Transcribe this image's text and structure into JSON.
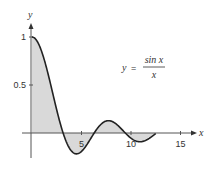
{
  "chart_data": {
    "type": "area",
    "title": "",
    "function": "sin(x)/x",
    "annotation": {
      "lhs": "y",
      "equals": "=",
      "numerator": "sin x",
      "denominator": "x"
    },
    "xlabel": "x",
    "ylabel": "y",
    "xlim": [
      0,
      16.5
    ],
    "ylim": [
      -0.3,
      1.1
    ],
    "x_ticks": [
      5,
      10,
      15
    ],
    "x_tick_labels": [
      "5",
      "10",
      "15"
    ],
    "y_ticks": [
      0.5,
      1
    ],
    "y_tick_labels": [
      "0.5",
      "1"
    ],
    "shaded_interval": [
      0,
      12.5
    ],
    "grid": false,
    "legend": null,
    "x": [
      0,
      1,
      2,
      3,
      3.1416,
      4,
      4.4934,
      5,
      6,
      6.2832,
      7,
      7.7253,
      8,
      9,
      9.4248,
      10,
      11,
      12,
      12.5
    ],
    "values": [
      1.0,
      0.841,
      0.455,
      0.047,
      0.0,
      -0.189,
      -0.217,
      -0.192,
      -0.047,
      0.0,
      0.094,
      0.128,
      0.124,
      0.046,
      0.0,
      -0.054,
      -0.091,
      -0.045,
      -0.005
    ],
    "colors": {
      "curve": "#222222",
      "fill": "#d9d9d9",
      "axis": "#555555"
    }
  }
}
